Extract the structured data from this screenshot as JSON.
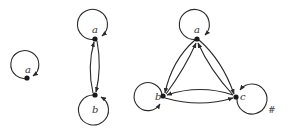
{
  "figure": {
    "end_mark": "#",
    "graphs": [
      {
        "id": "g1",
        "vertices": [
          {
            "label": "a"
          }
        ],
        "edges": [
          [
            "a",
            "a"
          ]
        ]
      },
      {
        "id": "g2",
        "vertices": [
          {
            "label": "a"
          },
          {
            "label": "b"
          }
        ],
        "edges": [
          [
            "a",
            "a"
          ],
          [
            "b",
            "b"
          ],
          [
            "a",
            "b"
          ],
          [
            "b",
            "a"
          ]
        ]
      },
      {
        "id": "g3",
        "vertices": [
          {
            "label": "a"
          },
          {
            "label": "b"
          },
          {
            "label": "c"
          }
        ],
        "edges": [
          [
            "a",
            "a"
          ],
          [
            "b",
            "b"
          ],
          [
            "c",
            "c"
          ],
          [
            "a",
            "b"
          ],
          [
            "b",
            "a"
          ],
          [
            "a",
            "c"
          ],
          [
            "c",
            "a"
          ],
          [
            "b",
            "c"
          ],
          [
            "c",
            "b"
          ]
        ]
      }
    ]
  },
  "labels": {
    "g1_a": "a",
    "g2_a": "a",
    "g2_b": "b",
    "g3_a": "a",
    "g3_b": "b",
    "g3_c": "c",
    "hash": "#"
  },
  "colors": {
    "stroke": "#2a2a2a",
    "node": "#1a1a1a",
    "background": "#ffffff"
  }
}
